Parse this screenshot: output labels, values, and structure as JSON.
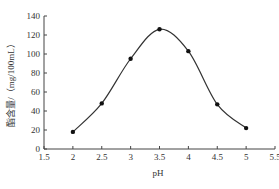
{
  "chart_data": {
    "type": "line",
    "title": "",
    "xlabel": "pH",
    "ylabel": "酯含量/（mg/100mL）",
    "x": [
      2,
      2.5,
      3,
      3.5,
      4,
      4.5,
      5
    ],
    "series": [
      {
        "name": "酯含量",
        "values": [
          18,
          48,
          95,
          126,
          103,
          47,
          22
        ]
      }
    ],
    "xlim": [
      1.5,
      5.5
    ],
    "ylim": [
      0,
      140
    ],
    "xticks": [
      "1.5",
      "2",
      "2.5",
      "3",
      "3.5",
      "4",
      "4.5",
      "5",
      "5.5"
    ],
    "yticks": [
      "0",
      "20",
      "40",
      "60",
      "80",
      "100",
      "120",
      "140"
    ],
    "grid": false,
    "legend": null,
    "line_color": "#333333",
    "marker": "filled-circle",
    "smooth": true
  }
}
